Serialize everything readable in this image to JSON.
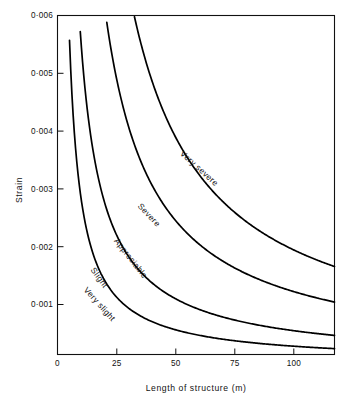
{
  "chart_data": {
    "type": "line",
    "title": "",
    "xlabel": "Length of structure (m)",
    "ylabel": "Strain",
    "xlim": [
      0,
      118
    ],
    "ylim": [
      0.00014,
      0.006
    ],
    "grid": false,
    "legend": "inline-curve-labels",
    "xticks": [
      0,
      25,
      50,
      75,
      100
    ],
    "xtick_labels": [
      "0",
      "25",
      "50",
      "75",
      "100"
    ],
    "yticks": [
      0.001,
      0.002,
      0.003,
      0.004,
      0.005,
      0.006
    ],
    "ytick_labels": [
      "0·001",
      "0·002",
      "0·003",
      "0·004",
      "0·005",
      "0·006"
    ],
    "series": [
      {
        "name": "Very slight",
        "label": "Very slight",
        "constant": 0.0285,
        "x": [
          4.6,
          6,
          8,
          10,
          15,
          20,
          25,
          30,
          35,
          40,
          50,
          60,
          75,
          90,
          103,
          118
        ],
        "values": [
          0.006,
          0.00475,
          0.00356,
          0.00285,
          0.0019,
          0.00143,
          0.00114,
          0.00095,
          0.00081,
          0.00071,
          0.00057,
          0.00048,
          0.00038,
          0.00032,
          0.00028,
          0.00024
        ]
      },
      {
        "name": "Slight",
        "label": "Slight",
        "constant": 0.0555,
        "x": [
          9.7,
          12,
          15,
          20,
          25,
          30,
          35,
          40,
          50,
          60,
          75,
          90,
          103,
          118
        ],
        "values": [
          0.006,
          0.00463,
          0.0037,
          0.00278,
          0.00222,
          0.00185,
          0.00159,
          0.00139,
          0.00111,
          0.00093,
          0.00074,
          0.00062,
          0.00054,
          0.00047
        ]
      },
      {
        "name": "Appreciable",
        "label": "Appreciable",
        "constant": 0.1235,
        "x": [
          21,
          25,
          30,
          35,
          40,
          50,
          63,
          75,
          90,
          103,
          118
        ],
        "values": [
          0.006,
          0.00494,
          0.00412,
          0.00353,
          0.00309,
          0.00247,
          0.00196,
          0.00165,
          0.00137,
          0.0012,
          0.00105
        ]
      },
      {
        "name": "Severe",
        "label": "Severe",
        "constant": 0.196,
        "x": [
          32,
          35,
          40,
          50,
          63,
          75,
          90,
          103,
          118
        ],
        "values": [
          0.006,
          0.0056,
          0.0049,
          0.00392,
          0.00311,
          0.00261,
          0.00218,
          0.0019,
          0.00166
        ]
      },
      {
        "name": "Very severe",
        "label": "Very severe",
        "constant": 0.196,
        "region": "above-top-curve",
        "x": [],
        "values": []
      }
    ],
    "curve_labels": [
      {
        "text": "Very severe",
        "x": 52,
        "y": 0.0036,
        "rotation": 42
      },
      {
        "text": "Severe",
        "x": 34,
        "y": 0.0027,
        "rotation": 47
      },
      {
        "text": "Appreciable",
        "x": 24,
        "y": 0.0021,
        "rotation": 52
      },
      {
        "text": "Slight",
        "x": 14,
        "y": 0.0016,
        "rotation": 54
      },
      {
        "text": "Very slight",
        "x": 11,
        "y": 0.00125,
        "rotation": 48
      }
    ],
    "colors": {
      "curve": "#000000",
      "axis": "#111111",
      "background": "#ffffff",
      "text": "#111111"
    }
  },
  "axes": {
    "y_title": "Strain",
    "x_title": "Length of structure (m)"
  }
}
